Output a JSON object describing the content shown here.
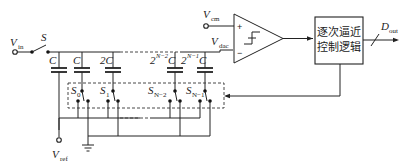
{
  "labels": {
    "vin": "V",
    "vin_sub": "in",
    "switch_s": "S",
    "vref": "V",
    "vref_sub": "ref",
    "vcm": "V",
    "vcm_sub": "cm",
    "vdac": "V",
    "vdac_sub": "dac",
    "dout": "D",
    "dout_sub": "out",
    "comparator_plus": "+",
    "comparator_minus": "−"
  },
  "capacitors": [
    {
      "label": "C",
      "sup": ""
    },
    {
      "label": "C",
      "sup": ""
    },
    {
      "label": "2C",
      "sup": ""
    },
    {
      "label_pre": "2",
      "sup": "N−2",
      "label_post": "C"
    },
    {
      "label_pre": "2",
      "sup": "N−1",
      "label_post": "C"
    }
  ],
  "switches": [
    {
      "label": "S",
      "sub": "0"
    },
    {
      "label": "S",
      "sub": "1"
    },
    {
      "label": "S",
      "sub": "N−2"
    },
    {
      "label": "S",
      "sub": "N−1"
    }
  ],
  "sar_logic": {
    "line1": "逐次逼近",
    "line2": "控制逻辑"
  }
}
